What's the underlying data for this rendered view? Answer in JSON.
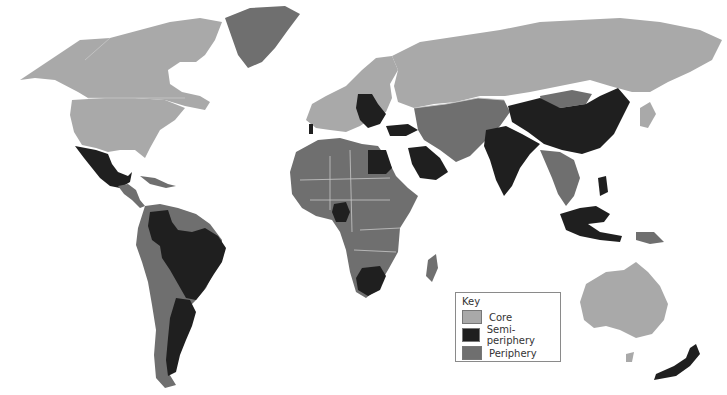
{
  "legend": {
    "title": "Key",
    "items": [
      {
        "label": "Core",
        "color": "#a9a9a9",
        "class": "core"
      },
      {
        "label": "Semi-periphery",
        "color": "#1f1f1f",
        "class": "semi"
      },
      {
        "label": "Periphery",
        "color": "#6f6f6f",
        "class": "peri"
      }
    ]
  },
  "map": {
    "regions": {
      "core": [
        "Canada",
        "United States",
        "Western Europe",
        "Scandinavia",
        "Russia",
        "Japan",
        "Australia"
      ],
      "semi_periphery": [
        "Mexico",
        "Colombia",
        "Venezuela",
        "Brazil",
        "Argentina",
        "Chile",
        "Poland",
        "Czechia",
        "Hungary",
        "Romania",
        "Bulgaria",
        "Balkans",
        "Turkey",
        "Egypt",
        "Saudi Arabia",
        "Nigeria",
        "South Africa",
        "India",
        "China",
        "Malaysia",
        "Indonesia",
        "Philippines",
        "New Zealand",
        "Portugal"
      ],
      "periphery": [
        "Greenland",
        "Central America",
        "Caribbean",
        "Peru",
        "Bolivia",
        "Paraguay",
        "Uruguay",
        "Guyana",
        "North Africa",
        "Sub-Saharan Africa",
        "Middle East",
        "Central Asia",
        "Southeast Asia",
        "Madagascar",
        "Papua New Guinea",
        "Mongolia"
      ]
    }
  }
}
